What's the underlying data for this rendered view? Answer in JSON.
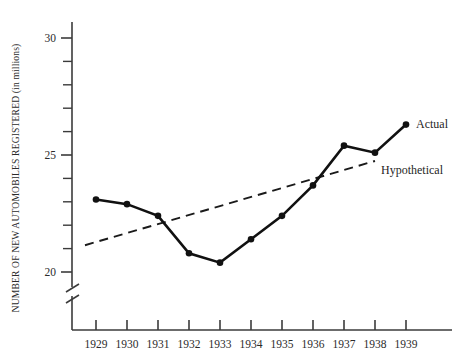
{
  "chart_data": {
    "type": "line",
    "title": "",
    "xlabel": "",
    "ylabel": "NUMBER OF NEW AUTOMOBILES REGISTERED (in millions)",
    "categories": [
      "1929",
      "1930",
      "1931",
      "1932",
      "1933",
      "1934",
      "1935",
      "1936",
      "1937",
      "1938",
      "1939"
    ],
    "x": [
      1929,
      1930,
      1931,
      1932,
      1933,
      1934,
      1935,
      1936,
      1937,
      1938,
      1939
    ],
    "ylim": [
      19.3,
      30.6
    ],
    "xlim": [
      1928.5,
      1939.6
    ],
    "y_ticks_major": [
      20,
      25,
      30
    ],
    "y_tick_labels": [
      "20",
      "25",
      "30"
    ],
    "y_ticks_minor": [
      21,
      22,
      23,
      24,
      26,
      27,
      28,
      29
    ],
    "y_axis_break": true,
    "grid": false,
    "legend_position": "inline-right",
    "series": [
      {
        "name": "Actual",
        "style": "solid",
        "markers": true,
        "values": [
          23.1,
          22.9,
          22.4,
          20.8,
          20.4,
          21.4,
          22.4,
          23.7,
          25.4,
          25.1,
          26.3
        ]
      },
      {
        "name": "Hypothetical",
        "style": "dashed",
        "markers": false,
        "endpoints_x": [
          1929,
          1939
        ],
        "endpoints_y": [
          21.2,
          24.8
        ],
        "values": [
          21.2,
          21.56,
          21.92,
          22.28,
          22.64,
          23.0,
          23.36,
          23.72,
          24.08,
          24.44,
          24.8
        ]
      }
    ],
    "annotations": [
      {
        "text": "Actual",
        "x": 1939,
        "y": 26.3
      },
      {
        "text": "Hypothetical",
        "x": 1939,
        "y": 24.5
      }
    ]
  },
  "labels": {
    "y_axis_title": "NUMBER OF NEW AUTOMOBILES REGISTERED (in millions)",
    "series_actual": "Actual",
    "series_hypothetical": "Hypothetical",
    "y_20": "20",
    "y_25": "25",
    "y_30": "30",
    "x_1929": "1929",
    "x_1930": "1930",
    "x_1931": "1931",
    "x_1932": "1932",
    "x_1933": "1933",
    "x_1934": "1934",
    "x_1935": "1935",
    "x_1936": "1936",
    "x_1937": "1937",
    "x_1938": "1938",
    "x_1939": "1939"
  },
  "colors": {
    "ink": "#111111",
    "axis": "#3b3b3b",
    "background": "#ffffff"
  }
}
